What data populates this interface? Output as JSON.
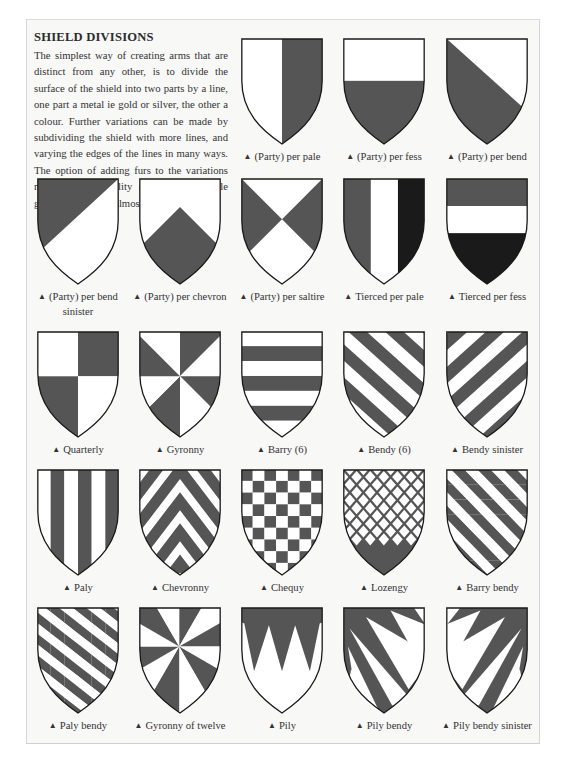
{
  "title": "SHIELD DIVISIONS",
  "intro": "The simplest way of creating arms that are distinct from any other, is to divide the surface of the shield into two parts by a line, one part a metal ie gold or silver, the other a colour. Further variations can be made by subdividing the shield with more lines, and varying the edges of the lines in many ways. The option of adding furs to the variations makes the possibility of new but simple geometric designs almost endless.",
  "bullet_icon": "▲",
  "colors": {
    "tincture_dark": "#555555",
    "tincture_black": "#1a1a1a",
    "tincture_white": "#ffffff",
    "outline": "#1a1a1a",
    "page": "#f8f8f7"
  },
  "shields": [
    {
      "id": "per-pale",
      "label": "(Party) per pale"
    },
    {
      "id": "per-fess",
      "label": "(Party) per fess"
    },
    {
      "id": "per-bend",
      "label": "(Party) per bend"
    },
    {
      "id": "per-bend-sinister",
      "label": "(Party) per bend sinister"
    },
    {
      "id": "per-chevron",
      "label": "(Party) per chevron"
    },
    {
      "id": "per-saltire",
      "label": "(Party) per saltire"
    },
    {
      "id": "tierced-per-pale",
      "label": "Tierced per pale"
    },
    {
      "id": "tierced-per-fess",
      "label": "Tierced per fess"
    },
    {
      "id": "quarterly",
      "label": "Quarterly"
    },
    {
      "id": "gyronny",
      "label": "Gyronny"
    },
    {
      "id": "barry-6",
      "label": "Barry (6)"
    },
    {
      "id": "bendy-6",
      "label": "Bendy (6)"
    },
    {
      "id": "bendy-sinister",
      "label": "Bendy sinister"
    },
    {
      "id": "paly",
      "label": "Paly"
    },
    {
      "id": "chevronny",
      "label": "Chevronny"
    },
    {
      "id": "chequy",
      "label": "Chequy"
    },
    {
      "id": "lozengy",
      "label": "Lozengy"
    },
    {
      "id": "barry-bendy",
      "label": "Barry bendy"
    },
    {
      "id": "paly-bendy",
      "label": "Paly bendy"
    },
    {
      "id": "gyronny-of-twelve",
      "label": "Gyronny of twelve"
    },
    {
      "id": "pily",
      "label": "Pily"
    },
    {
      "id": "pily-bendy",
      "label": "Pily bendy"
    },
    {
      "id": "pily-bendy-sinister",
      "label": "Pily bendy sinister"
    }
  ]
}
